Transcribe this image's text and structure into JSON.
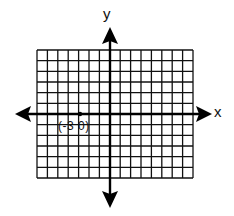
{
  "diagram": {
    "type": "coordinate-plane",
    "grid": {
      "columns": 15,
      "rows": 12,
      "color": "#111111"
    },
    "axes": {
      "x_label": "x",
      "y_label": "y",
      "color": "#000000"
    },
    "point": {
      "x": -3,
      "y": 0,
      "label": "(-3 0)"
    }
  }
}
